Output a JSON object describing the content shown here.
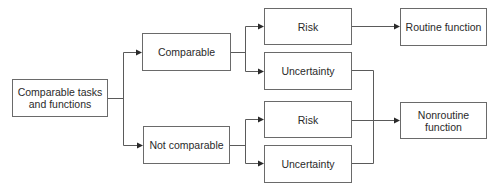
{
  "diagram": {
    "type": "flowchart",
    "direction": "left-to-right",
    "colors": {
      "stroke": "#5a5a5a",
      "box_border": "#6a6a6a",
      "text": "#2a2a2a",
      "background": "#ffffff"
    },
    "nodes": {
      "root": {
        "label": "Comparable tasks\nand functions"
      },
      "comparable": {
        "label": "Comparable"
      },
      "not_comparable": {
        "label": "Not comparable"
      },
      "risk_1": {
        "label": "Risk"
      },
      "uncertainty_1": {
        "label": "Uncertainty"
      },
      "risk_2": {
        "label": "Risk"
      },
      "uncertainty_2": {
        "label": "Uncertainty"
      },
      "routine": {
        "label": "Routine function"
      },
      "nonroutine": {
        "label": "Nonroutine\nfunction"
      }
    },
    "edges": [
      {
        "from": "root",
        "to": "comparable"
      },
      {
        "from": "root",
        "to": "not_comparable"
      },
      {
        "from": "comparable",
        "to": "risk_1"
      },
      {
        "from": "comparable",
        "to": "uncertainty_1"
      },
      {
        "from": "not_comparable",
        "to": "risk_2"
      },
      {
        "from": "not_comparable",
        "to": "uncertainty_2"
      },
      {
        "from": "risk_1",
        "to": "routine"
      },
      {
        "from": "uncertainty_1",
        "to": "nonroutine"
      },
      {
        "from": "risk_2",
        "to": "nonroutine"
      },
      {
        "from": "uncertainty_2",
        "to": "nonroutine"
      }
    ]
  }
}
